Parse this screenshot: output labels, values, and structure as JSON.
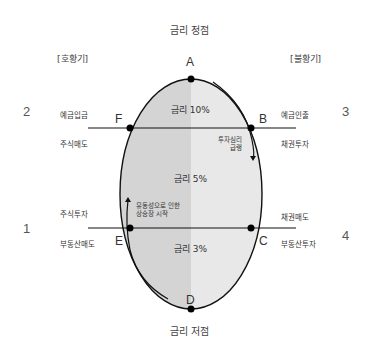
{
  "titles": {
    "top": "금리 정점",
    "bottom": "금리 저점"
  },
  "phases": {
    "left": "[호황기]",
    "right": "[불황기]"
  },
  "points": {
    "A": "A",
    "B": "B",
    "C": "C",
    "D": "D",
    "E": "E",
    "F": "F"
  },
  "quadrants": {
    "q1": {
      "number": "1",
      "upper": "주식투자",
      "lower": "부동산매도"
    },
    "q2": {
      "number": "2",
      "upper": "예금입금",
      "lower": "주식매도"
    },
    "q3": {
      "number": "3",
      "upper": "예금인출",
      "lower": "채권투자"
    },
    "q4": {
      "number": "4",
      "upper": "채권매도",
      "lower": "부동산투자"
    }
  },
  "rates": {
    "top": "금리 10%",
    "middle": "금리 5%",
    "bottom": "금리 3%"
  },
  "notes": {
    "right_line1": "투자심리",
    "right_line2": "급랭",
    "left_line1": "유동성으로 인한",
    "left_line2": "상승장 시작"
  },
  "colors": {
    "left_fill": "#d4d4d4",
    "right_fill": "#e8e8e8",
    "stroke": "#111111"
  }
}
